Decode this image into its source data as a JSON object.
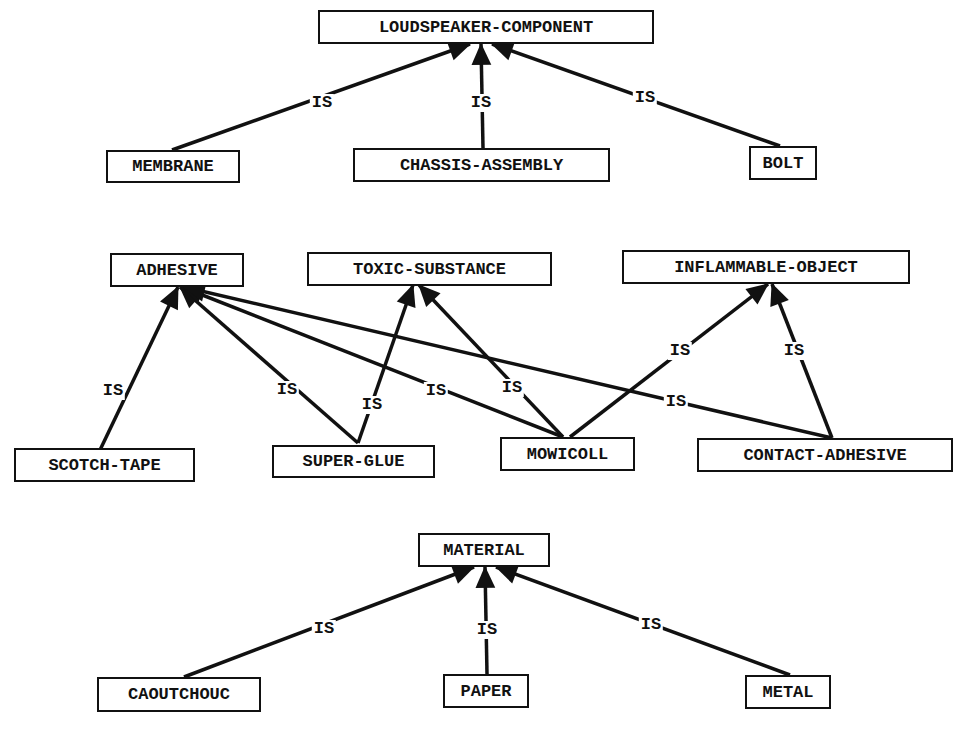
{
  "diagram": {
    "type": "is-a hierarchy",
    "relation_label": "IS",
    "groups": [
      {
        "parents": [
          "LOUDSPEAKER-COMPONENT"
        ],
        "children": [
          "MEMBRANE",
          "CHASSIS-ASSEMBLY",
          "BOLT"
        ]
      },
      {
        "parents": [
          "ADHESIVE",
          "TOXIC-SUBSTANCE",
          "INFLAMMABLE-OBJECT"
        ],
        "children": [
          "SCOTCH-TAPE",
          "SUPER-GLUE",
          "MOWICOLL",
          "CONTACT-ADHESIVE"
        ]
      },
      {
        "parents": [
          "MATERIAL"
        ],
        "children": [
          "CAOUTCHOUC",
          "PAPER",
          "METAL"
        ]
      }
    ],
    "nodes": {
      "loudspeaker_component": "LOUDSPEAKER-COMPONENT",
      "membrane": "MEMBRANE",
      "chassis_assembly": "CHASSIS-ASSEMBLY",
      "bolt": "BOLT",
      "adhesive": "ADHESIVE",
      "toxic_substance": "TOXIC-SUBSTANCE",
      "inflammable_object": "INFLAMMABLE-OBJECT",
      "scotch_tape": "SCOTCH-TAPE",
      "super_glue": "SUPER-GLUE",
      "mowicoll": "MOWICOLL",
      "contact_adhesive": "CONTACT-ADHESIVE",
      "material": "MATERIAL",
      "caoutchouc": "CAOUTCHOUC",
      "paper": "PAPER",
      "metal": "METAL"
    },
    "edges": [
      {
        "from": "MEMBRANE",
        "to": "LOUDSPEAKER-COMPONENT",
        "label": "IS"
      },
      {
        "from": "CHASSIS-ASSEMBLY",
        "to": "LOUDSPEAKER-COMPONENT",
        "label": "IS"
      },
      {
        "from": "BOLT",
        "to": "LOUDSPEAKER-COMPONENT",
        "label": "IS"
      },
      {
        "from": "SCOTCH-TAPE",
        "to": "ADHESIVE",
        "label": "IS"
      },
      {
        "from": "SUPER-GLUE",
        "to": "ADHESIVE",
        "label": "IS"
      },
      {
        "from": "SUPER-GLUE",
        "to": "TOXIC-SUBSTANCE",
        "label": "IS"
      },
      {
        "from": "MOWICOLL",
        "to": "ADHESIVE",
        "label": "IS"
      },
      {
        "from": "MOWICOLL",
        "to": "TOXIC-SUBSTANCE",
        "label": "IS"
      },
      {
        "from": "MOWICOLL",
        "to": "INFLAMMABLE-OBJECT",
        "label": "IS"
      },
      {
        "from": "CONTACT-ADHESIVE",
        "to": "ADHESIVE",
        "label": "IS"
      },
      {
        "from": "CONTACT-ADHESIVE",
        "to": "INFLAMMABLE-OBJECT",
        "label": "IS"
      },
      {
        "from": "CAOUTCHOUC",
        "to": "MATERIAL",
        "label": "IS"
      },
      {
        "from": "PAPER",
        "to": "MATERIAL",
        "label": "IS"
      },
      {
        "from": "METAL",
        "to": "MATERIAL",
        "label": "IS"
      }
    ]
  }
}
